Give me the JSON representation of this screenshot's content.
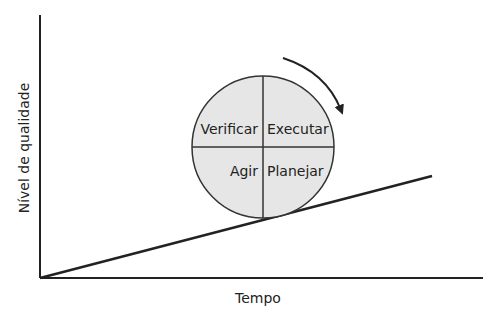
{
  "diagram": {
    "type": "pdca-cycle-on-slope",
    "axes": {
      "x_label": "Tempo",
      "y_label": "Nível de qualidade"
    },
    "cycle": {
      "quadrants": [
        {
          "position": "top-left",
          "label": "Verificar"
        },
        {
          "position": "top-right",
          "label": "Executar"
        },
        {
          "position": "bottom-left",
          "label": "Agir"
        },
        {
          "position": "bottom-right",
          "label": "Planejar"
        }
      ],
      "rotation": "clockwise",
      "fill_color": "#e6e6e6"
    },
    "colors": {
      "line": "#222222",
      "text": "#222222"
    }
  }
}
